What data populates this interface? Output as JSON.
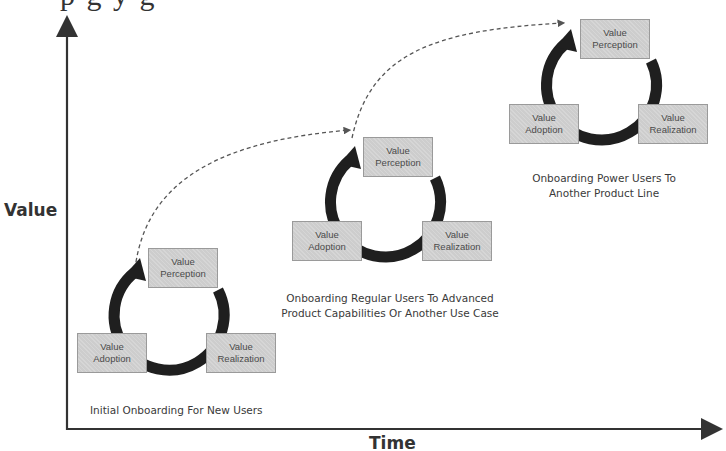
{
  "header": {
    "clipped_book_text": "p g y g"
  },
  "axes": {
    "y_label": "Value",
    "x_label": "Time",
    "color": "#333333"
  },
  "colors": {
    "box_fill": "#cdcdcd",
    "box_border": "#9a9a9a",
    "box_text": "#4a4a4a",
    "cycle_arrow": "#1f1f1f",
    "connector": "#555555"
  },
  "cycles": [
    {
      "stage": 1,
      "caption_lines": [
        "Initial Onboarding For New Users"
      ],
      "boxes": {
        "perception": [
          "Value",
          "Perception"
        ],
        "adoption": [
          "Value",
          "Adoption"
        ],
        "realization": [
          "Value",
          "Realization"
        ]
      }
    },
    {
      "stage": 2,
      "caption_lines": [
        "Onboarding Regular Users To Advanced",
        "Product Capabilities Or Another Use Case"
      ],
      "boxes": {
        "perception": [
          "Value",
          "Perception"
        ],
        "adoption": [
          "Value",
          "Adoption"
        ],
        "realization": [
          "Value",
          "Realization"
        ]
      }
    },
    {
      "stage": 3,
      "caption_lines": [
        "Onboarding Power Users To",
        "Another Product Line"
      ],
      "boxes": {
        "perception": [
          "Value",
          "Perception"
        ],
        "adoption": [
          "Value",
          "Adoption"
        ],
        "realization": [
          "Value",
          "Realization"
        ]
      }
    }
  ],
  "connectors": [
    {
      "from_stage": 1,
      "to_stage": 2,
      "style": "dashed"
    },
    {
      "from_stage": 2,
      "to_stage": 3,
      "style": "dashed"
    }
  ]
}
